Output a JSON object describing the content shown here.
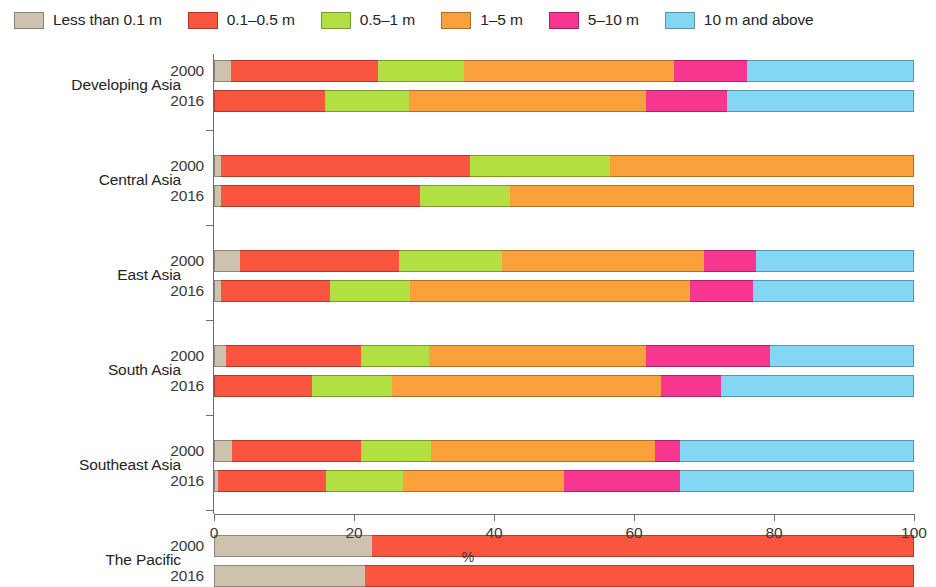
{
  "legend": {
    "items": [
      {
        "label": "Less than 0.1 m",
        "color": "#ccc2ad"
      },
      {
        "label": "0.1–0.5 m",
        "color": "#f9553f"
      },
      {
        "label": "0.5–1 m",
        "color": "#b2e043"
      },
      {
        "label": "1–5 m",
        "color": "#fba13c"
      },
      {
        "label": "5–10 m",
        "color": "#f6368f"
      },
      {
        "label": "10 m and above",
        "color": "#84d7f4"
      }
    ]
  },
  "axis": {
    "x_title": "%",
    "x_ticks": [
      0,
      20,
      40,
      60,
      80,
      100
    ],
    "x_min": 0,
    "x_max": 100
  },
  "chart_data": {
    "type": "bar",
    "orientation": "horizontal",
    "stacked": true,
    "title": "",
    "xlabel": "%",
    "ylabel": "",
    "xlim": [
      0,
      100
    ],
    "grid": false,
    "legend_position": "top",
    "series": [
      {
        "name": "Less than 0.1 m",
        "color": "#ccc2ad"
      },
      {
        "name": "0.1–0.5 m",
        "color": "#f9553f"
      },
      {
        "name": "0.5–1 m",
        "color": "#b2e043"
      },
      {
        "name": "1–5 m",
        "color": "#fba13c"
      },
      {
        "name": "5–10 m",
        "color": "#f6368f"
      },
      {
        "name": "10 m and above",
        "color": "#84d7f4"
      }
    ],
    "groups": [
      {
        "category": "Developing Asia",
        "bars": [
          {
            "year": "2000",
            "values": [
              2.4,
              21.0,
              12.3,
              30.0,
              10.4,
              23.9
            ]
          },
          {
            "year": "2016",
            "values": [
              0.0,
              15.9,
              12.0,
              33.8,
              11.6,
              26.7
            ]
          }
        ]
      },
      {
        "category": "Central Asia",
        "bars": [
          {
            "year": "2000",
            "values": [
              1.0,
              35.5,
              20.1,
              43.4,
              0.0,
              0.0
            ]
          },
          {
            "year": "2016",
            "values": [
              1.0,
              28.4,
              12.9,
              57.7,
              0.0,
              0.0
            ]
          }
        ]
      },
      {
        "category": "East Asia",
        "bars": [
          {
            "year": "2000",
            "values": [
              3.7,
              22.8,
              14.6,
              28.9,
              7.4,
              22.6
            ]
          },
          {
            "year": "2016",
            "values": [
              1.0,
              15.5,
              11.5,
              40.0,
              9.0,
              23.0
            ]
          }
        ]
      },
      {
        "category": "South Asia",
        "bars": [
          {
            "year": "2000",
            "values": [
              1.7,
              19.3,
              9.7,
              31.0,
              17.7,
              20.6
            ]
          },
          {
            "year": "2016",
            "values": [
              0.0,
              14.0,
              11.4,
              38.5,
              8.5,
              27.6
            ]
          }
        ]
      },
      {
        "category": "Southeast Asia",
        "bars": [
          {
            "year": "2000",
            "values": [
              2.5,
              18.5,
              10.0,
              32.0,
              3.5,
              33.5
            ]
          },
          {
            "year": "2016",
            "values": [
              0.5,
              15.5,
              11.0,
              23.0,
              16.5,
              33.5
            ]
          }
        ]
      },
      {
        "category": "The Pacific",
        "bars": [
          {
            "year": "2000",
            "values": [
              22.5,
              77.5,
              0.0,
              0.0,
              0.0,
              0.0
            ]
          },
          {
            "year": "2016",
            "values": [
              21.5,
              78.5,
              0.0,
              0.0,
              0.0,
              0.0
            ]
          }
        ]
      }
    ]
  }
}
